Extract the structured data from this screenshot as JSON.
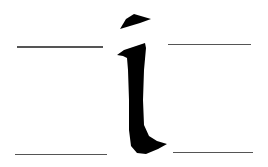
{
  "image": {
    "subject": "Calligraphic lowercase letter with guide lines",
    "letter": "i",
    "colors": {
      "background": "#ffffff",
      "ink": "#000000",
      "guide_line": "#555555"
    },
    "guide_lines": [
      {
        "name": "top-left",
        "x1": 17,
        "x2": 103,
        "y": 46
      },
      {
        "name": "top-right",
        "x1": 168,
        "x2": 251,
        "y": 44
      },
      {
        "name": "bottom-left",
        "x1": 15,
        "x2": 107,
        "y": 154
      },
      {
        "name": "bottom-right",
        "x1": 173,
        "x2": 253,
        "y": 152
      }
    ]
  }
}
